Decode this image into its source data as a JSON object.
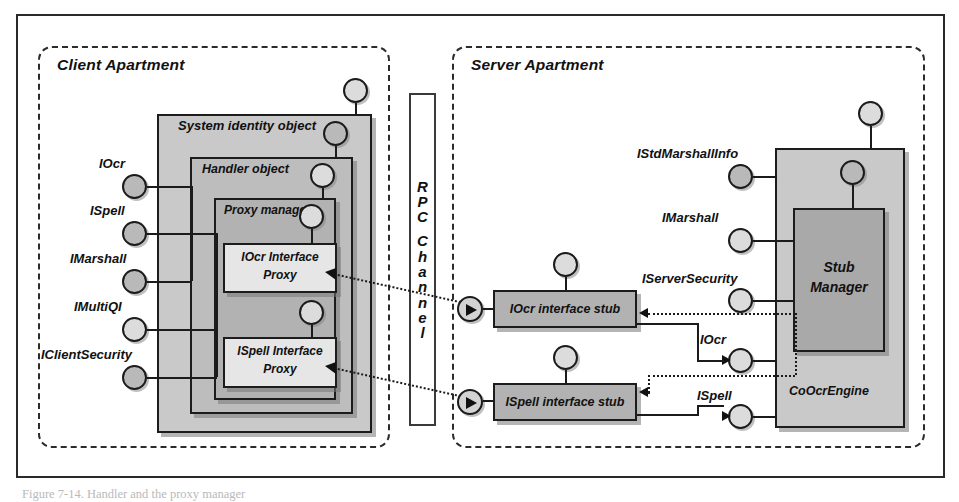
{
  "figure": {
    "caption": "Figure 7-14. Handler and the proxy manager"
  },
  "apartments": [
    {
      "id": "client",
      "title": "Client Apartment"
    },
    {
      "id": "server",
      "title": "Server Apartment"
    }
  ],
  "rpc_channel": {
    "label": "RPC Channel",
    "letters": [
      "R",
      "P",
      "C",
      "",
      "C",
      "h",
      "a",
      "n",
      "n",
      "e",
      "l"
    ]
  },
  "client": {
    "boxes": {
      "system_identity_object": "System identity object",
      "handler_object": "Handler object",
      "proxy_manager": "Proxy manager",
      "iocr_interface_proxy": "IOcr Interface\nProxy",
      "iocr_interface_proxy_line1": "IOcr Interface",
      "iocr_interface_proxy_line2": "Proxy",
      "ispell_interface_proxy_line1": "ISpell Interface",
      "ispell_interface_proxy_line2": "Proxy"
    },
    "interfaces": [
      {
        "name": "IOcr"
      },
      {
        "name": "ISpell"
      },
      {
        "name": "IMarshall"
      },
      {
        "name": "IMultiQI"
      },
      {
        "name": "IClientSecurity"
      }
    ]
  },
  "server": {
    "boxes": {
      "coocrengine": "CoOcrEngine",
      "stub_manager_line1": "Stub",
      "stub_manager_line2": "Manager",
      "iocr_interface_stub": "IOcr interface stub",
      "ispell_interface_stub": "ISpell interface stub"
    },
    "interfaces": [
      {
        "name": "IStdMarshallInfo"
      },
      {
        "name": "IMarshall"
      },
      {
        "name": "IServerSecurity"
      },
      {
        "name": "IOcr"
      },
      {
        "name": "ISpell"
      }
    ]
  },
  "colors": {
    "ink": "#1b1b1b",
    "fill_outer": "#c9c9c9",
    "fill_mid": "#bdbdbd",
    "fill_inner": "#b2b2b2",
    "fill_light": "#e6e6e6",
    "lollipop": "#b9b9b9",
    "page": "#ffffff"
  }
}
